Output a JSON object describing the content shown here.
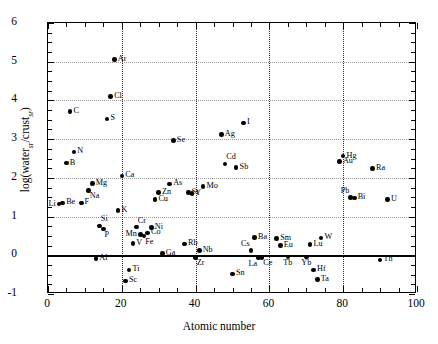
{
  "chart_data": {
    "type": "scatter",
    "title": "",
    "xlabel": "Atomic number",
    "ylabel": "log(water_sr/crust_sr)",
    "ylabel_parts": {
      "prefix": "log(water",
      "sub1": "sr",
      "mid": "/crust",
      "sub2": "sr",
      "suffix": ")"
    },
    "xlim": [
      0,
      100
    ],
    "ylim": [
      -1,
      6
    ],
    "xticks": [
      0,
      20,
      40,
      60,
      80,
      100
    ],
    "yticks": [
      -1,
      0,
      1,
      2,
      3,
      4,
      5,
      6
    ],
    "x_minor_step": 5,
    "y_minor_step": 0.25,
    "grid": {
      "horizontal": "dotted-light",
      "vertical": "dotted-dark",
      "vgrid_at": [
        20,
        40,
        60,
        80
      ],
      "hgrid_at": [
        1,
        2,
        3,
        4,
        5
      ],
      "zero_line": true
    },
    "legend": "none",
    "point_label_key": "element symbol",
    "points": [
      {
        "label": "Li",
        "x": 3,
        "y": 1.32,
        "lp": "left"
      },
      {
        "label": "Be",
        "x": 4,
        "y": 1.35,
        "lp": "right"
      },
      {
        "label": "B",
        "x": 5,
        "y": 2.38,
        "lp": "right"
      },
      {
        "label": "C",
        "x": 6,
        "y": 3.72,
        "lp": "right"
      },
      {
        "label": "N",
        "x": 7,
        "y": 2.67,
        "lp": "right"
      },
      {
        "label": "F",
        "x": 9,
        "y": 1.35,
        "lp": "right"
      },
      {
        "label": "Na",
        "x": 11,
        "y": 1.68,
        "lp": "below-right"
      },
      {
        "label": "Mg",
        "x": 12,
        "y": 1.86,
        "lp": "right"
      },
      {
        "label": "Al",
        "x": 13,
        "y": -0.08,
        "lp": "right"
      },
      {
        "label": "Si",
        "x": 14,
        "y": 0.76,
        "lp": "above-right"
      },
      {
        "label": "P",
        "x": 15,
        "y": 0.68,
        "lp": "below-right"
      },
      {
        "label": "S",
        "x": 16,
        "y": 3.52,
        "lp": "right"
      },
      {
        "label": "Cl",
        "x": 17,
        "y": 4.1,
        "lp": "right"
      },
      {
        "label": "Ar",
        "x": 18,
        "y": 5.06,
        "lp": "right"
      },
      {
        "label": "K",
        "x": 19,
        "y": 1.15,
        "lp": "right"
      },
      {
        "label": "Ca",
        "x": 20,
        "y": 2.05,
        "lp": "right"
      },
      {
        "label": "Sc",
        "x": 21,
        "y": -0.66,
        "lp": "right"
      },
      {
        "label": "Ti",
        "x": 22,
        "y": -0.38,
        "lp": "right"
      },
      {
        "label": "V",
        "x": 23,
        "y": 0.3,
        "lp": "right"
      },
      {
        "label": "Cr",
        "x": 24,
        "y": 0.73,
        "lp": "above-right"
      },
      {
        "label": "Mn",
        "x": 25,
        "y": 0.54,
        "lp": "left"
      },
      {
        "label": "Fe",
        "x": 26,
        "y": 0.5,
        "lp": "below-right"
      },
      {
        "label": "Co",
        "x": 27,
        "y": 0.58,
        "lp": "right"
      },
      {
        "label": "Ni",
        "x": 28,
        "y": 0.72,
        "lp": "right"
      },
      {
        "label": "Cu",
        "x": 29,
        "y": 1.44,
        "lp": "right"
      },
      {
        "label": "Zn",
        "x": 30,
        "y": 1.62,
        "lp": "right"
      },
      {
        "label": "Ga",
        "x": 31,
        "y": 0.04,
        "lp": "right"
      },
      {
        "label": "As",
        "x": 33,
        "y": 1.84,
        "lp": "right"
      },
      {
        "label": "Se",
        "x": 34,
        "y": 2.97,
        "lp": "right"
      },
      {
        "label": "Rb",
        "x": 37,
        "y": 0.29,
        "lp": "right"
      },
      {
        "label": "Sr",
        "x": 38,
        "y": 1.62,
        "lp": "right"
      },
      {
        "label": "Y",
        "x": 39,
        "y": 1.6,
        "lp": "right"
      },
      {
        "label": "Zr",
        "x": 40,
        "y": -0.05,
        "lp": "below-right"
      },
      {
        "label": "Nb",
        "x": 41,
        "y": 0.12,
        "lp": "right"
      },
      {
        "label": "Mo",
        "x": 42,
        "y": 1.78,
        "lp": "right"
      },
      {
        "label": "Ag",
        "x": 47,
        "y": 3.12,
        "lp": "right"
      },
      {
        "label": "Cd",
        "x": 48,
        "y": 2.36,
        "lp": "above-right"
      },
      {
        "label": "Sn",
        "x": 50,
        "y": -0.48,
        "lp": "right"
      },
      {
        "label": "Sb",
        "x": 51,
        "y": 2.26,
        "lp": "right"
      },
      {
        "label": "I",
        "x": 53,
        "y": 3.42,
        "lp": "right"
      },
      {
        "label": "Cs",
        "x": 55,
        "y": 0.12,
        "lp": "above-left"
      },
      {
        "label": "Ba",
        "x": 56,
        "y": 0.46,
        "lp": "right"
      },
      {
        "label": "La",
        "x": 57,
        "y": -0.07,
        "lp": "below-left"
      },
      {
        "label": "Ce",
        "x": 58,
        "y": -0.05,
        "lp": "below-right"
      },
      {
        "label": "Sm",
        "x": 62,
        "y": 0.44,
        "lp": "right"
      },
      {
        "label": "Eu",
        "x": 63,
        "y": 0.26,
        "lp": "right"
      },
      {
        "label": "Tb",
        "x": 65,
        "y": -0.04,
        "lp": "below"
      },
      {
        "label": "Yb",
        "x": 70,
        "y": -0.04,
        "lp": "below"
      },
      {
        "label": "Lu",
        "x": 71,
        "y": 0.28,
        "lp": "right"
      },
      {
        "label": "Hf",
        "x": 72,
        "y": -0.38,
        "lp": "right"
      },
      {
        "label": "Ta",
        "x": 73,
        "y": -0.62,
        "lp": "right"
      },
      {
        "label": "W",
        "x": 74,
        "y": 0.45,
        "lp": "right"
      },
      {
        "label": "Au",
        "x": 79,
        "y": 2.42,
        "lp": "right"
      },
      {
        "label": "Hg",
        "x": 80,
        "y": 2.56,
        "lp": "right"
      },
      {
        "label": "Pb",
        "x": 82,
        "y": 1.5,
        "lp": "above-left"
      },
      {
        "label": "Bi",
        "x": 83,
        "y": 1.48,
        "lp": "right"
      },
      {
        "label": "Ra",
        "x": 88,
        "y": 2.24,
        "lp": "right"
      },
      {
        "label": "Th",
        "x": 90,
        "y": -0.12,
        "lp": "right"
      },
      {
        "label": "U",
        "x": 92,
        "y": 1.44,
        "lp": "right"
      }
    ]
  }
}
